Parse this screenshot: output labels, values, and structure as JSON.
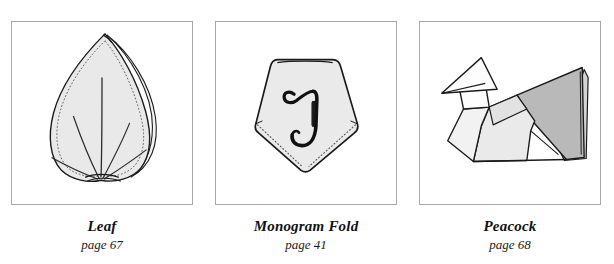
{
  "gallery": {
    "background_color": "#ffffff",
    "frame_border_color": "#a8a8a8",
    "panels": [
      {
        "id": "leaf",
        "title": "Leaf",
        "page": "page 67",
        "figure_name": "leaf-fold-illustration",
        "colors": {
          "paper_fill": "#e9e9e9",
          "outline": "#1a1a1a",
          "stitch_dots": "#555555",
          "vein_line": "#2a2a2a"
        }
      },
      {
        "id": "monogram-fold",
        "title": "Monogram Fold",
        "page": "page 41",
        "figure_name": "monogram-fold-illustration",
        "monogram_letter": "J",
        "colors": {
          "paper_fill": "#eaeaea",
          "outline": "#1a1a1a",
          "stitch_dots": "#555555",
          "monogram_ink": "#111111"
        }
      },
      {
        "id": "peacock",
        "title": "Peacock",
        "page": "page 68",
        "figure_name": "peacock-fold-illustration",
        "colors": {
          "head_fill": "#fdfdfd",
          "body_fill": "#eaeaea",
          "tail_fill": "#b9b9b9",
          "tail_edge_fill": "#d4d4d4",
          "outline": "#1a1a1a"
        }
      }
    ]
  }
}
